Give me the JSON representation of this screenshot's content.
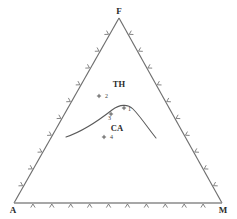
{
  "figure": {
    "type": "ternary-diagram",
    "background_color": "#ffffff",
    "line_color": "#6e6e6e",
    "text_color": "#2b2b2b",
    "curve_color": "#5a5a5a"
  },
  "vertices": {
    "top": {
      "label": "F",
      "x": 119,
      "y": 18
    },
    "bottom_left": {
      "label": "A",
      "x": 14,
      "y": 203
    },
    "bottom_right": {
      "label": "M",
      "x": 222,
      "y": 203
    }
  },
  "fields": [
    {
      "name": "field-th",
      "label": "TH",
      "x": 119,
      "y": 87
    },
    {
      "name": "field-ca",
      "label": "CA",
      "x": 117,
      "y": 131
    }
  ],
  "points": [
    {
      "id": "1",
      "label": "1",
      "x": 124,
      "y": 108,
      "label_x": 128,
      "label_y": 111
    },
    {
      "id": "2",
      "label": "2",
      "x": 99,
      "y": 96,
      "label_x": 105,
      "label_y": 98
    },
    {
      "id": "3",
      "label": "3",
      "x": 111,
      "y": 114,
      "label_x": 108,
      "label_y": 120
    },
    {
      "id": "4",
      "label": "4",
      "x": 104,
      "y": 137,
      "label_x": 110,
      "label_y": 139
    }
  ],
  "boundary_curve": {
    "name": "th-ca-boundary",
    "path": "M 66 137 C 84 131 98 121 112 110 C 120 104 128 104 133 109 C 140 116 148 128 156 138",
    "start": {
      "x": 66,
      "y": 137
    },
    "peak": {
      "x": 122,
      "y": 105
    },
    "end": {
      "x": 156,
      "y": 138
    }
  },
  "ticks": {
    "count_per_edge": 10,
    "style": "chevron-outward",
    "edges": [
      "left",
      "right",
      "bottom"
    ]
  },
  "chart_data": {
    "type": "scatter",
    "title": "",
    "xlabel": "",
    "ylabel": "",
    "axes": [
      "F",
      "A",
      "M"
    ],
    "regions": [
      "TH",
      "CA"
    ],
    "series": [
      {
        "name": "samples",
        "labels": [
          "1",
          "2",
          "3",
          "4"
        ]
      }
    ]
  }
}
